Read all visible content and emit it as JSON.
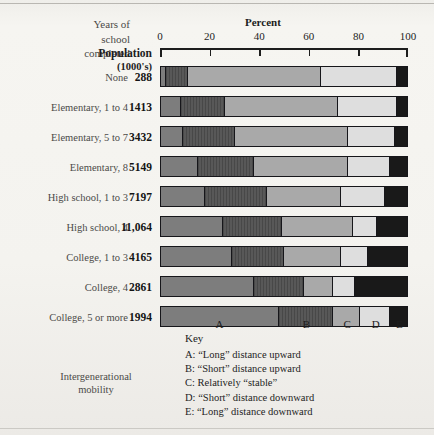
{
  "header": {
    "years_label_lines": [
      "Years of",
      "school",
      "completed"
    ],
    "population_label": "Population",
    "population_sublabel": "(1000's)",
    "percent_title": "Percent"
  },
  "mobility_note_lines": [
    "Intergenerational",
    "mobility"
  ],
  "key": {
    "title": "Key",
    "entries": [
      "A: “Long” distance upward",
      "B: “Short” distance upward",
      "C: Relatively “stable”",
      "D: “Short” distance downward",
      "E: “Long” distance downward"
    ]
  },
  "segment_markers": [
    {
      "label": "A",
      "pos": 24
    },
    {
      "label": "B",
      "pos": 59
    },
    {
      "label": "C",
      "pos": 75.5
    },
    {
      "label": "D",
      "pos": 87
    },
    {
      "label": "E",
      "pos": 96.5
    }
  ],
  "colors": {
    "A": "#7d7d7d",
    "B": "#585858",
    "C": "#a9a9a9",
    "D": "#dedede",
    "E": "#191919",
    "ink": "#1d1d1d",
    "paper": "#f4f3ef"
  },
  "chart_data": {
    "type": "bar",
    "xlabel": "Percent",
    "ylabel": "Years of school completed",
    "xlim": [
      0,
      100
    ],
    "xticks": [
      0,
      20,
      40,
      60,
      80,
      100
    ],
    "grid": false,
    "legend_position": "below",
    "orientation": "horizontal",
    "stacked": true,
    "series": [
      {
        "name": "A",
        "label": "“Long” distance upward",
        "values": [
          2,
          8,
          9,
          15,
          18,
          25,
          29,
          38,
          48
        ]
      },
      {
        "name": "B",
        "label": "“Short” distance upward",
        "values": [
          9,
          18,
          21,
          23,
          25,
          24,
          21,
          20,
          22
        ]
      },
      {
        "name": "C",
        "label": "Relatively “stable”",
        "values": [
          54,
          46,
          46,
          38,
          30,
          29,
          23,
          12,
          11
        ]
      },
      {
        "name": "D",
        "label": "“Short” distance downward",
        "values": [
          31,
          24,
          19,
          17,
          18,
          10,
          11,
          9,
          12
        ]
      },
      {
        "name": "E",
        "label": "“Long” distance downward",
        "values": [
          4,
          4,
          5,
          7,
          9,
          12,
          16,
          21,
          7
        ]
      }
    ],
    "categories": [
      "None",
      "Elementary, 1 to 4",
      "Elementary, 5 to 7",
      "Elementary, 8",
      "High school, 1 to 3",
      "High school, 4",
      "College, 1 to 3",
      "College, 4",
      "College, 5 or more"
    ],
    "population_thousands": [
      "288",
      "1413",
      "3432",
      "5149",
      "7197",
      "11,064",
      "4165",
      "2861",
      "1994"
    ]
  },
  "rows": [
    {
      "label": "None",
      "population": "288",
      "segments": [
        2,
        9,
        54,
        31,
        4
      ]
    },
    {
      "label": "Elementary, 1 to 4",
      "population": "1413",
      "segments": [
        8,
        18,
        46,
        24,
        4
      ]
    },
    {
      "label": "Elementary, 5 to 7",
      "population": "3432",
      "segments": [
        9,
        21,
        46,
        19,
        5
      ]
    },
    {
      "label": "Elementary, 8",
      "population": "5149",
      "segments": [
        15,
        23,
        38,
        17,
        7
      ]
    },
    {
      "label": "High school, 1 to 3",
      "population": "7197",
      "segments": [
        18,
        25,
        30,
        18,
        9
      ]
    },
    {
      "label": "High school, 4",
      "population": "11,064",
      "segments": [
        25,
        24,
        29,
        10,
        12
      ]
    },
    {
      "label": "College, 1 to 3",
      "population": "4165",
      "segments": [
        29,
        21,
        23,
        11,
        16
      ]
    },
    {
      "label": "College, 4",
      "population": "2861",
      "segments": [
        38,
        20,
        12,
        9,
        21
      ]
    },
    {
      "label": "College, 5 or more",
      "population": "1994",
      "segments": [
        48,
        22,
        11,
        12,
        7
      ]
    }
  ]
}
